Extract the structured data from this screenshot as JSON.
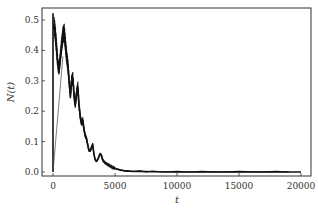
{
  "chart_data": {
    "type": "line",
    "title": "",
    "xlabel": "t",
    "ylabel": "N(t)",
    "xlim": [
      -800,
      20800
    ],
    "ylim": [
      -0.012,
      0.535
    ],
    "grid": false,
    "legend": null,
    "xticks": [
      0,
      5000,
      10000,
      15000,
      20000
    ],
    "xtick_labels": [
      "0",
      "5000",
      "10000",
      "15000",
      "20000"
    ],
    "yticks": [
      0.0,
      0.1,
      0.2,
      0.3,
      0.4,
      0.5
    ],
    "ytick_labels": [
      "0.0",
      "0.1",
      "0.2",
      "0.3",
      "0.4",
      "0.5"
    ],
    "series": [
      {
        "name": "N(t)",
        "color": "#111111",
        "x": [
          0,
          0,
          0,
          100,
          200,
          300,
          400,
          500,
          600,
          700,
          800,
          900,
          1000,
          1100,
          1200,
          1300,
          1400,
          1500,
          1600,
          1700,
          1800,
          1900,
          2000,
          2100,
          2200,
          2300,
          2400,
          2500,
          2600,
          2700,
          2800,
          2900,
          3000,
          3100,
          3200,
          3300,
          3400,
          3500,
          3600,
          3700,
          3800,
          3900,
          4000,
          4200,
          4400,
          4600,
          4800,
          5000,
          5300,
          5600,
          6000,
          7000,
          8000,
          10000,
          12000,
          15000,
          18000,
          20000
        ],
        "values": [
          0.0,
          0.52,
          0.47,
          0.48,
          0.45,
          0.4,
          0.35,
          0.34,
          0.38,
          0.42,
          0.45,
          0.46,
          0.42,
          0.38,
          0.35,
          0.3,
          0.25,
          0.3,
          0.31,
          0.25,
          0.22,
          0.26,
          0.28,
          0.22,
          0.18,
          0.16,
          0.17,
          0.14,
          0.12,
          0.11,
          0.09,
          0.07,
          0.07,
          0.08,
          0.09,
          0.06,
          0.04,
          0.035,
          0.04,
          0.05,
          0.06,
          0.055,
          0.04,
          0.03,
          0.025,
          0.02,
          0.015,
          0.012,
          0.008,
          0.005,
          0.003,
          0.002,
          0.001,
          0.0,
          0.0,
          0.0,
          0.0,
          0.0
        ]
      },
      {
        "name": "initial-rise",
        "color": "#444444",
        "x": [
          0,
          800
        ],
        "values": [
          0.0,
          0.38
        ]
      }
    ]
  }
}
